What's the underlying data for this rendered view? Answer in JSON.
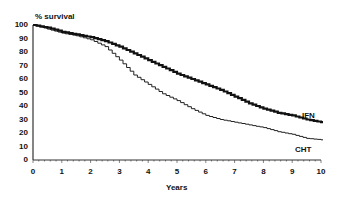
{
  "chart_data": {
    "type": "line",
    "title": "",
    "xlabel": "Years",
    "ylabel": "% survival",
    "xlim": [
      0,
      10
    ],
    "ylim": [
      0,
      100
    ],
    "grid": false,
    "legend": "inline labels at right end of curves",
    "x_ticks": [
      "0",
      "1",
      "2",
      "3",
      "4",
      "5",
      "6",
      "7",
      "8",
      "9",
      "10"
    ],
    "y_ticks": [
      "100",
      "90",
      "80",
      "70",
      "60",
      "50",
      "40",
      "30",
      "20",
      "10",
      "0"
    ],
    "series": [
      {
        "name": "IFN",
        "style": "thick step line",
        "x": [
          0,
          0.5,
          1,
          1.5,
          2,
          2.5,
          3,
          3.5,
          4,
          4.5,
          5,
          5.5,
          6,
          6.5,
          7,
          7.5,
          8,
          8.5,
          9,
          9.5,
          10
        ],
        "y": [
          100,
          98,
          95,
          93,
          91,
          88,
          84,
          79,
          74,
          69,
          64,
          60,
          56,
          52,
          47,
          42,
          38,
          35,
          33,
          30,
          28
        ]
      },
      {
        "name": "CHT",
        "style": "thin step line",
        "x": [
          0,
          0.5,
          1,
          1.5,
          2,
          2.5,
          3,
          3.5,
          4,
          4.5,
          5,
          5.5,
          6,
          6.5,
          7,
          7.5,
          8,
          8.5,
          9,
          9.5,
          10
        ],
        "y": [
          100,
          97,
          94,
          92,
          89,
          84,
          74,
          63,
          56,
          49,
          44,
          38,
          33,
          30,
          28,
          26,
          24,
          21,
          19,
          16,
          15
        ]
      }
    ]
  },
  "labels": {
    "ylabel": "% survival",
    "xlabel": "Years",
    "ifn": "IFN",
    "cht": "CHT"
  }
}
